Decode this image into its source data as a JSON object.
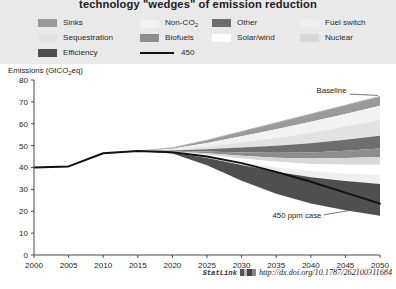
{
  "title": "technology \"wedges\" of emission reduction",
  "legend": {
    "items": [
      {
        "label": "Sinks",
        "color": "#9a9a9a",
        "type": "swatch",
        "col": 0,
        "row": 0
      },
      {
        "label": "Sequestration",
        "color": "#e2e2e2",
        "type": "swatch",
        "col": 0,
        "row": 1
      },
      {
        "label": "Efficiency",
        "color": "#4f4f4f",
        "type": "swatch",
        "col": 0,
        "row": 2
      },
      {
        "label": "Non-CO2",
        "color": "#f2f2f2",
        "type": "swatch",
        "col": 1,
        "row": 0
      },
      {
        "label": "Biofuels",
        "color": "#8d8d8d",
        "type": "swatch",
        "col": 1,
        "row": 1
      },
      {
        "label": "450",
        "color": "#111111",
        "type": "line",
        "col": 1,
        "row": 2
      },
      {
        "label": "Other",
        "color": "#6e6e6e",
        "type": "swatch",
        "col": 2,
        "row": 0
      },
      {
        "label": "Solar/wind",
        "color": "#ffffff",
        "type": "swatch",
        "col": 2,
        "row": 1
      },
      {
        "label": "Fuel switch",
        "color": "#efefef",
        "type": "swatch",
        "col": 3,
        "row": 0
      },
      {
        "label": "Nuclear",
        "color": "#d8d8d8",
        "type": "swatch",
        "col": 3,
        "row": 1
      }
    ]
  },
  "footer": {
    "statlink_label": "StatLink",
    "url": "http://dx.doi.org/10.1787/262100311684"
  },
  "chart_data": {
    "type": "area",
    "title": "technology \"wedges\" of emission reduction",
    "xlabel": "",
    "ylabel": "Emissions (GtCO2eq)",
    "ylabel_display": "Emissions (GtCO₂eq)",
    "xlim": [
      2000,
      2050
    ],
    "ylim": [
      0,
      80
    ],
    "yticks": [
      0,
      10,
      20,
      30,
      40,
      50,
      60,
      70,
      80
    ],
    "xticks": [
      2000,
      2005,
      2010,
      2015,
      2020,
      2025,
      2030,
      2035,
      2040,
      2045,
      2050
    ],
    "grid": false,
    "legend_position": "top",
    "x": [
      2000,
      2005,
      2010,
      2015,
      2020,
      2025,
      2030,
      2035,
      2040,
      2045,
      2050
    ],
    "baseline": {
      "name": "Baseline",
      "values": [
        40.0,
        40.5,
        46.5,
        47.5,
        49.0,
        52.5,
        56.5,
        60.5,
        64.5,
        68.5,
        72.5
      ]
    },
    "mitigation_path": {
      "name": "450 ppm case",
      "label": "450",
      "style": "solid black line",
      "values": [
        40.0,
        40.5,
        46.5,
        47.5,
        47.0,
        45.0,
        42.0,
        38.0,
        33.5,
        28.5,
        23.5
      ]
    },
    "wedges_order_top_to_bottom": [
      "Sinks",
      "Non-CO2",
      "Sequestration",
      "Other",
      "Biofuels",
      "Nuclear",
      "Solar/wind",
      "Fuel switch",
      "Efficiency"
    ],
    "series": [
      {
        "name": "Sinks",
        "color": "#9a9a9a",
        "values": [
          0,
          0,
          0,
          0,
          0.4,
          1.3,
          2.2,
          3.0,
          3.6,
          4.0,
          4.3
        ]
      },
      {
        "name": "Non-CO2",
        "color": "#f2f2f2",
        "values": [
          0,
          0,
          0,
          0,
          0.5,
          1.6,
          2.8,
          4.0,
          5.0,
          5.8,
          6.5
        ]
      },
      {
        "name": "Sequestration",
        "color": "#e2e2e2",
        "values": [
          0,
          0,
          0,
          0,
          0.3,
          1.2,
          2.4,
          3.6,
          4.8,
          6.0,
          7.2
        ]
      },
      {
        "name": "Other",
        "color": "#6e6e6e",
        "values": [
          0,
          0,
          0,
          0,
          0.3,
          1.1,
          2.2,
          3.2,
          4.2,
          5.0,
          5.8
        ]
      },
      {
        "name": "Biofuels",
        "color": "#8d8d8d",
        "values": [
          0,
          0,
          0,
          0,
          0.2,
          0.8,
          1.5,
          2.2,
          2.8,
          3.4,
          3.9
        ]
      },
      {
        "name": "Nuclear",
        "color": "#d8d8d8",
        "values": [
          0,
          0,
          0,
          0,
          0.2,
          0.7,
          1.3,
          1.9,
          2.5,
          3.0,
          3.5
        ]
      },
      {
        "name": "Solar/wind",
        "color": "#ffffff",
        "values": [
          0,
          0,
          0,
          0,
          0.2,
          0.8,
          1.6,
          2.4,
          3.2,
          4.0,
          4.7
        ]
      },
      {
        "name": "Fuel switch",
        "color": "#efefef",
        "values": [
          0,
          0,
          0,
          0,
          0.2,
          0.7,
          1.4,
          2.1,
          2.8,
          3.5,
          4.1
        ]
      },
      {
        "name": "Efficiency",
        "color": "#4f4f4f",
        "values": [
          0,
          0,
          0,
          0,
          0.3,
          3.3,
          7.1,
          10.1,
          12.1,
          13.3,
          14.5
        ]
      }
    ],
    "annotations": [
      {
        "text": "Baseline",
        "x": 2043,
        "y": 74
      },
      {
        "text": "450 ppm case",
        "x": 2038,
        "y": 17
      }
    ]
  }
}
